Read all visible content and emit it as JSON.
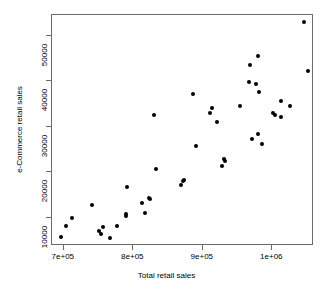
{
  "chart_data": {
    "type": "scatter",
    "title": "",
    "xlabel": "Total retail sales",
    "ylabel": "e-Commerce retail sales",
    "xlim": [
      683000,
      1060000
    ],
    "ylim": [
      3800,
      54500
    ],
    "grid": false,
    "legend": null,
    "point_color": "#000000",
    "point_symbol": "filled-circle",
    "xticks": [
      700000,
      800000,
      900000,
      1000000
    ],
    "xticklabels": [
      "7e+05",
      "8e+05",
      "9e+05",
      "1e+06"
    ],
    "yticks": [
      10000,
      20000,
      30000,
      40000,
      50000
    ],
    "yticklabels": [
      "10000",
      "20000",
      "30000",
      "40000",
      "50000"
    ],
    "points": [
      {
        "x": 696000,
        "y": 5700
      },
      {
        "x": 703000,
        "y": 8200
      },
      {
        "x": 712000,
        "y": 9900
      },
      {
        "x": 740000,
        "y": 12700
      },
      {
        "x": 751000,
        "y": 7200
      },
      {
        "x": 754000,
        "y": 6400
      },
      {
        "x": 757000,
        "y": 8000
      },
      {
        "x": 766000,
        "y": 5500
      },
      {
        "x": 776000,
        "y": 8100
      },
      {
        "x": 789000,
        "y": 10300
      },
      {
        "x": 790000,
        "y": 10900
      },
      {
        "x": 791000,
        "y": 16700
      },
      {
        "x": 812000,
        "y": 13200
      },
      {
        "x": 817000,
        "y": 11000
      },
      {
        "x": 822000,
        "y": 14400
      },
      {
        "x": 824000,
        "y": 14200
      },
      {
        "x": 830000,
        "y": 32500
      },
      {
        "x": 833000,
        "y": 20600
      },
      {
        "x": 869000,
        "y": 17200
      },
      {
        "x": 872000,
        "y": 18000
      },
      {
        "x": 873000,
        "y": 18300
      },
      {
        "x": 886000,
        "y": 37200
      },
      {
        "x": 890000,
        "y": 25800
      },
      {
        "x": 910000,
        "y": 33000
      },
      {
        "x": 913000,
        "y": 34100
      },
      {
        "x": 920000,
        "y": 31000
      },
      {
        "x": 927000,
        "y": 21400
      },
      {
        "x": 931000,
        "y": 22800
      },
      {
        "x": 932000,
        "y": 22500
      },
      {
        "x": 953000,
        "y": 34500
      },
      {
        "x": 967000,
        "y": 39700
      },
      {
        "x": 968000,
        "y": 43500
      },
      {
        "x": 971000,
        "y": 27200
      },
      {
        "x": 977000,
        "y": 39300
      },
      {
        "x": 979000,
        "y": 45500
      },
      {
        "x": 980000,
        "y": 28400
      },
      {
        "x": 981000,
        "y": 37700
      },
      {
        "x": 985000,
        "y": 26200
      },
      {
        "x": 1001000,
        "y": 33000
      },
      {
        "x": 1004000,
        "y": 32500
      },
      {
        "x": 1012000,
        "y": 35600
      },
      {
        "x": 1013000,
        "y": 32200
      },
      {
        "x": 1025000,
        "y": 34500
      },
      {
        "x": 1046000,
        "y": 53000
      },
      {
        "x": 1052000,
        "y": 42200
      }
    ]
  }
}
